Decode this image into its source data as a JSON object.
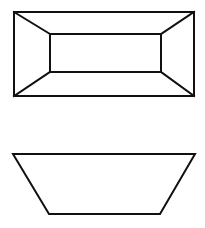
{
  "diagram": {
    "title": "",
    "line_color": "#111111",
    "background": "#ffffff",
    "figures": [
      {
        "name": "top-view",
        "description": "Truncated pyramid (frustum) viewed from above: outer rectangle, inner rectangle, four corner edges connecting them"
      },
      {
        "name": "front-view",
        "description": "Same solid viewed from the front: trapezoid, wide edge on top"
      }
    ]
  }
}
